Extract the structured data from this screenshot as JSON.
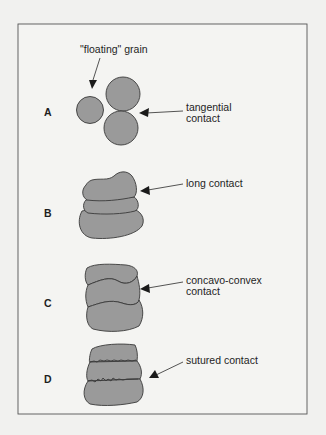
{
  "figure": {
    "frame": {
      "x": 18,
      "y": 24,
      "width": 290,
      "height": 390,
      "stroke": "#555555",
      "background": "#f4f4f2"
    },
    "grain_fill": "#9a9a9a",
    "panels": [
      {
        "letter": "A",
        "labels": [
          "tangential",
          "contact"
        ],
        "extra_label": "\"floating\" grain"
      },
      {
        "letter": "B",
        "labels": [
          "long contact"
        ]
      },
      {
        "letter": "C",
        "labels": [
          "concavo-convex",
          "contact"
        ]
      },
      {
        "letter": "D",
        "labels": [
          "sutured contact"
        ]
      }
    ]
  }
}
